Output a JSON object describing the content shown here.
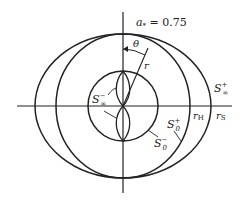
{
  "diagram": {
    "title": "a* = 0.75",
    "title_parts": {
      "a": "a",
      "sub": "*",
      "rest": " = 0.75"
    },
    "labels": {
      "theta": "θ",
      "r": "r",
      "s_inf_plus": {
        "base": "S",
        "sup": "+",
        "sub": "∞"
      },
      "s_inf_minus": {
        "base": "S",
        "sup": "−",
        "sub": "∞"
      },
      "s0_plus": {
        "base": "S",
        "sup": "+",
        "sub": "0"
      },
      "s0_minus": {
        "base": "S",
        "sup": "−",
        "sub": "0"
      },
      "r_h": {
        "base": "r",
        "sub": "H"
      },
      "r_s": {
        "base": "r",
        "sub": "S"
      }
    },
    "colors": {
      "stroke": "#222222",
      "background": "#ffffff"
    }
  }
}
